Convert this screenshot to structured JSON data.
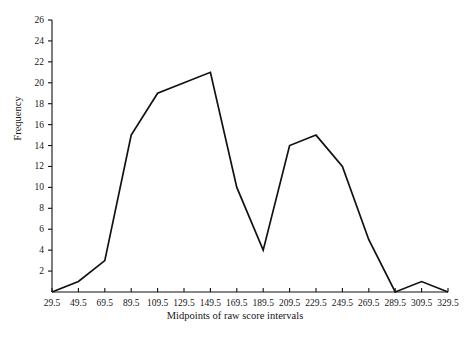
{
  "chart_data": {
    "type": "line",
    "title": "",
    "subtitle": "",
    "xlabel": "Midpoints of raw score intervals",
    "ylabel": "Frequency",
    "grid": false,
    "legend": null,
    "legend_position": "none",
    "line_color": "#111111",
    "categories": [
      "29.5",
      "49.5",
      "69.5",
      "89.5",
      "109.5",
      "129.5",
      "149.5",
      "169.5",
      "189.5",
      "209.5",
      "229.5",
      "249.5",
      "269.5",
      "289.5",
      "309.5",
      "329.5"
    ],
    "x": [
      29.5,
      49.5,
      69.5,
      89.5,
      109.5,
      129.5,
      149.5,
      169.5,
      189.5,
      209.5,
      229.5,
      249.5,
      269.5,
      289.5,
      309.5,
      329.5
    ],
    "values": [
      0,
      1,
      3,
      15,
      19,
      20,
      21,
      10,
      4,
      14,
      15,
      12,
      5,
      0,
      1,
      0
    ],
    "xlim": [
      29.5,
      329.5
    ],
    "ylim": [
      0,
      26
    ],
    "ytick_labels": [
      "2",
      "4",
      "6",
      "8",
      "10",
      "12",
      "14",
      "16",
      "18",
      "20",
      "22",
      "24",
      "26"
    ],
    "yticks": [
      2,
      4,
      6,
      8,
      10,
      12,
      14,
      16,
      18,
      20,
      22,
      24,
      26
    ],
    "ytick_step": 2,
    "xtick_labels": [
      "29.5",
      "49.5",
      "69.5",
      "89.5",
      "109.5",
      "129.5",
      "149.5",
      "169.5",
      "189.5",
      "209.5",
      "229.5",
      "249.5",
      "269.5",
      "289.5",
      "309.5",
      "329.5"
    ]
  }
}
